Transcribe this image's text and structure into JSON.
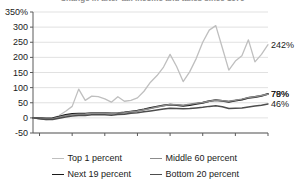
{
  "title": {
    "text": "Change in after-tax income and taxes since 1979",
    "clipped": true
  },
  "chart_data": {
    "type": "line",
    "title": "Change in after-tax income and taxes since 1979",
    "xlabel": "",
    "ylabel": "",
    "xlim": [
      1979,
      2015
    ],
    "ylim": [
      -50,
      350
    ],
    "ytick_suffix": "%",
    "grid": true,
    "legend_position": "bottom",
    "x_ticks": [
      1980,
      1985,
      1990,
      1995,
      2000,
      2005,
      2010,
      2015
    ],
    "y_ticks": [
      -50,
      0,
      50,
      100,
      150,
      200,
      250,
      300,
      350
    ],
    "y_tick_labels": [
      "-50",
      "0",
      "50",
      "100",
      "150",
      "200",
      "250",
      "300",
      "350%"
    ],
    "x": [
      1979,
      1980,
      1981,
      1982,
      1983,
      1984,
      1985,
      1986,
      1987,
      1988,
      1989,
      1990,
      1991,
      1992,
      1993,
      1994,
      1995,
      1996,
      1997,
      1998,
      1999,
      2000,
      2001,
      2002,
      2003,
      2004,
      2005,
      2006,
      2007,
      2008,
      2009,
      2010,
      2011,
      2012,
      2013,
      2014,
      2015
    ],
    "series": [
      {
        "name": "Top 1 percent",
        "color": "#bfbfbf",
        "width": 1.3,
        "end_label": "242%",
        "end_value": 242,
        "values": [
          0,
          -3,
          -6,
          -4,
          8,
          22,
          38,
          95,
          58,
          72,
          70,
          63,
          52,
          70,
          55,
          58,
          66,
          88,
          118,
          140,
          168,
          210,
          170,
          120,
          152,
          196,
          250,
          290,
          305,
          232,
          158,
          188,
          205,
          258,
          185,
          210,
          242
        ]
      },
      {
        "name": "Next 19 percent",
        "color": "#1a1a1a",
        "width": 1.8,
        "end_label": "79%",
        "end_value": 79,
        "values": [
          0,
          -1,
          -2,
          -1,
          4,
          10,
          13,
          14,
          14,
          16,
          16,
          16,
          15,
          16,
          18,
          21,
          24,
          28,
          33,
          37,
          41,
          44,
          42,
          40,
          42,
          46,
          50,
          55,
          59,
          56,
          53,
          57,
          60,
          66,
          69,
          73,
          79
        ]
      },
      {
        "name": "Middle 60 percent",
        "color": "#8c8c8c",
        "width": 1.5,
        "end_label": "78%",
        "end_value": 78,
        "values": [
          0,
          -2,
          -4,
          -3,
          2,
          7,
          10,
          12,
          13,
          15,
          15,
          15,
          14,
          16,
          17,
          20,
          23,
          27,
          31,
          36,
          40,
          44,
          43,
          42,
          45,
          48,
          51,
          55,
          58,
          57,
          55,
          58,
          62,
          67,
          70,
          74,
          78
        ]
      },
      {
        "name": "Bottom 20 percent",
        "color": "#4d4d4d",
        "width": 1.5,
        "end_label": "46%",
        "end_value": 46,
        "values": [
          0,
          -3,
          -5,
          -5,
          -1,
          3,
          6,
          8,
          8,
          10,
          10,
          10,
          9,
          11,
          12,
          15,
          17,
          20,
          23,
          26,
          29,
          32,
          31,
          30,
          31,
          33,
          35,
          38,
          40,
          37,
          31,
          32,
          33,
          36,
          39,
          42,
          46
        ]
      }
    ]
  },
  "legend": {
    "items": [
      {
        "label": "Top 1 percent",
        "color": "#bfbfbf",
        "width": 1.3
      },
      {
        "label": "Middle 60 percent",
        "color": "#8c8c8c",
        "width": 1.5
      },
      {
        "label": "Next 19 percent",
        "color": "#1a1a1a",
        "width": 1.8
      },
      {
        "label": "Bottom 20 percent",
        "color": "#4d4d4d",
        "width": 1.5
      }
    ]
  }
}
